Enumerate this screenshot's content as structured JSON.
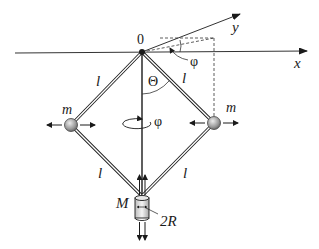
{
  "diagram": {
    "type": "centrifugal governor (Watt regulator) schematic",
    "labels": {
      "origin": "0",
      "x_axis": "x",
      "y_axis": "y",
      "phi_top": "φ",
      "theta": "Θ",
      "rod_upper_right": "l",
      "rod_upper_left": "l",
      "rod_lower_left": "l",
      "rod_lower_right": "l",
      "mass_left": "m",
      "mass_right": "m",
      "rotation_phi": "φ",
      "sleeve_mass": "M",
      "sleeve_diameter": "2R"
    },
    "colors": {
      "line": "#1a1a1a",
      "rod_fill": "#ffffff",
      "ball_light": "#e0e0e0",
      "ball_dark": "#7a7a7a",
      "dashed": "#333333"
    }
  }
}
